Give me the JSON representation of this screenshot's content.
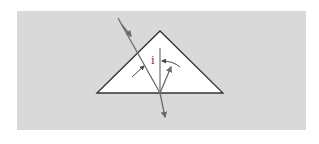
{
  "diagram": {
    "colors": {
      "page_background": "#ffffff",
      "panel_background": "#d9d9d9",
      "prism_fill": "#ffffff",
      "prism_stroke": "#333333",
      "ray_color": "#6b6b6b",
      "arrow_color": "#4a4a4a",
      "normal_color": "#555555",
      "label_color": "#444444"
    },
    "panel": {
      "x": 17,
      "y": 11,
      "width": 289,
      "height": 119
    },
    "prism": {
      "vertices": [
        [
          97,
          93
        ],
        [
          160,
          31
        ],
        [
          223,
          93
        ]
      ]
    },
    "normal_line": {
      "x1": 160,
      "y1": 48,
      "x2": 160,
      "y2": 92
    },
    "incident_ray": {
      "x1": 118,
      "y1": 18,
      "x2": 160,
      "y2": 93
    },
    "exit_ray": {
      "x1": 160,
      "y1": 93,
      "x2": 165,
      "y2": 118
    },
    "reflected_ray": {
      "x1": 160,
      "y1": 93,
      "x2": 172,
      "y2": 66
    },
    "angle_label": {
      "text": "i",
      "x": 151,
      "y": 64
    },
    "annotations": [
      {
        "name": "left-angle-arrow",
        "from": [
          132,
          77
        ],
        "to": [
          144,
          66
        ]
      },
      {
        "name": "right-curved-arrow",
        "from": [
          180,
          67
        ],
        "to": [
          161,
          61
        ]
      }
    ]
  }
}
